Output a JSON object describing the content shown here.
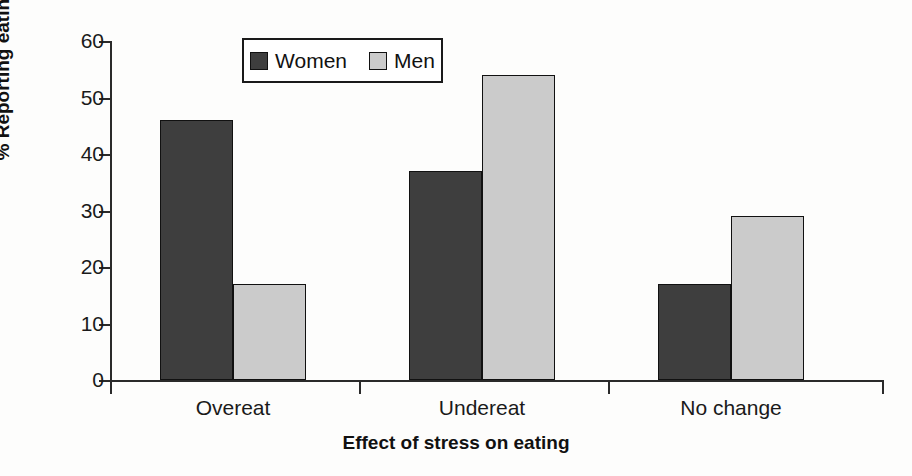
{
  "chart_data": {
    "type": "bar",
    "title": "",
    "categories": [
      "Overeat",
      "Undereat",
      "No change"
    ],
    "series": [
      {
        "name": "Women",
        "values": [
          46,
          37,
          17
        ],
        "color": "#3e3e3e"
      },
      {
        "name": "Men",
        "values": [
          17,
          54,
          29
        ],
        "color": "#cbcbcb"
      }
    ],
    "xlabel": "Effect of stress on eating",
    "ylabel": "% Reporting eating change",
    "ylim": [
      0,
      60
    ],
    "yticks": [
      0,
      10,
      20,
      30,
      40,
      50,
      60
    ],
    "ytick_labels": [
      "0",
      "10",
      "20",
      "30",
      "40",
      "50",
      "60"
    ],
    "grid": false,
    "legend_position": "top-center-left",
    "legend_entries": [
      "Women",
      "Men"
    ],
    "background_color": "#fdfdfc",
    "axis_color": "#2a2a2a"
  }
}
